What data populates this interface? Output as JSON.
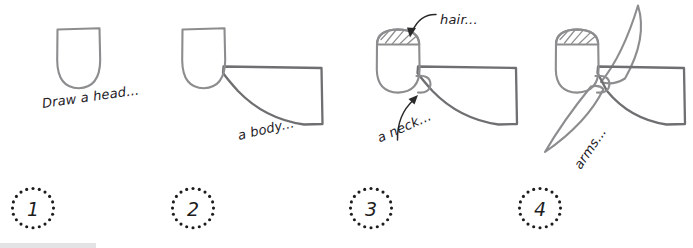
{
  "figure": {
    "style": "hand-drawn pencil sketch tutorial",
    "background_color": "#ffffff",
    "ink_color": "#8d8d8f",
    "text_color": "#23201f",
    "badge_color": "#1d1d1d"
  },
  "steps": [
    {
      "number": "1",
      "caption": "Draw a head...",
      "caption_rotation_deg": -8,
      "parts_drawn": [
        "head"
      ],
      "annotation": null
    },
    {
      "number": "2",
      "caption": "a body...",
      "caption_rotation_deg": -13,
      "parts_drawn": [
        "head",
        "body"
      ],
      "annotation": null
    },
    {
      "number": "3",
      "caption_hair": "hair...",
      "caption_hair_rotation_deg": 0,
      "caption_neck": "a neck...",
      "caption_neck_rotation_deg": -24,
      "parts_drawn": [
        "head",
        "body",
        "hair",
        "neck"
      ],
      "annotation": "two leader arrows point to the hair and the neck"
    },
    {
      "number": "4",
      "caption": "arms...",
      "caption_rotation_deg": -56,
      "parts_drawn": [
        "head",
        "body",
        "hair",
        "neck",
        "arm-upper",
        "arm-lower"
      ],
      "annotation": null
    }
  ],
  "labels": {
    "head": "Draw a head...",
    "body": "a body...",
    "hair": "hair...",
    "neck": "a neck...",
    "arms": "arms..."
  },
  "badges": {
    "one": "1",
    "two": "2",
    "three": "3",
    "four": "4"
  }
}
